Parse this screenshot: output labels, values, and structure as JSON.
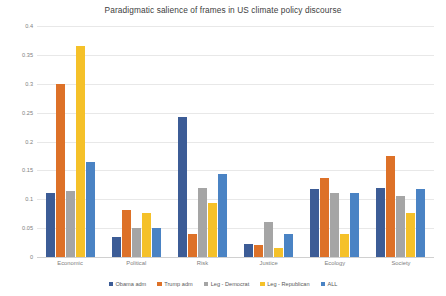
{
  "chart_data": {
    "type": "bar",
    "title": "Paradigmatic salience of frames in US climate policy discourse",
    "xlabel": "",
    "ylabel": "",
    "ylim": [
      0,
      0.4
    ],
    "yticks": [
      "0",
      "0.05",
      "0.1",
      "0.15",
      "0.2",
      "0.25",
      "0.3",
      "0.35",
      "0.4"
    ],
    "ytick_values": [
      0,
      0.05,
      0.1,
      0.15,
      0.2,
      0.25,
      0.3,
      0.35,
      0.4
    ],
    "grid": true,
    "legend_position": "bottom",
    "categories": [
      "Economic",
      "Political",
      "Risk",
      "Justice",
      "Ecology",
      "Society"
    ],
    "series": [
      {
        "name": "Obama adm",
        "color": "#3c5c96",
        "values": [
          0.11,
          0.034,
          0.242,
          0.022,
          0.117,
          0.12
        ]
      },
      {
        "name": "Trump adm",
        "color": "#dd7128",
        "values": [
          0.3,
          0.082,
          0.039,
          0.021,
          0.137,
          0.175
        ]
      },
      {
        "name": "Leg - Democrat",
        "color": "#a5a5a5",
        "values": [
          0.115,
          0.05,
          0.119,
          0.061,
          0.11,
          0.105
        ]
      },
      {
        "name": "Leg - Republican",
        "color": "#f5c129",
        "values": [
          0.365,
          0.077,
          0.093,
          0.015,
          0.04,
          0.077
        ]
      },
      {
        "name": "ALL",
        "color": "#4a83c4",
        "values": [
          0.165,
          0.051,
          0.143,
          0.039,
          0.11,
          0.117
        ]
      }
    ]
  }
}
